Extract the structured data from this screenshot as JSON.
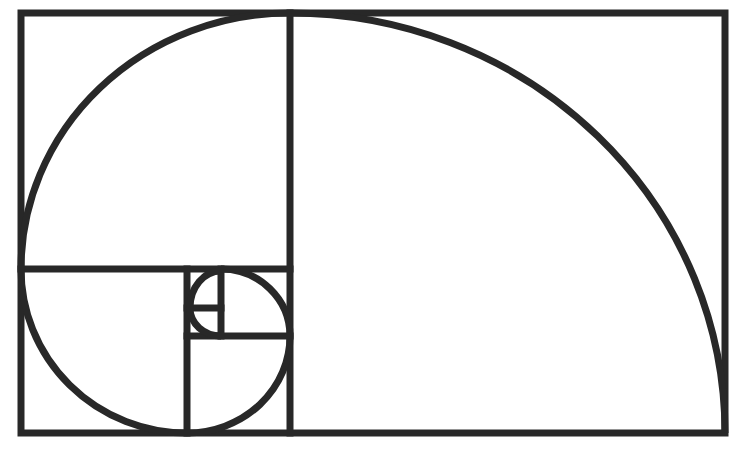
{
  "diagram": {
    "stroke_color": "#282828",
    "background": "#ffffff",
    "stroke_width": 7,
    "outer_rect": {
      "x": 21,
      "y": 13,
      "w": 704,
      "h": 420
    },
    "divider_lines": [
      {
        "name": "main-vertical-divider",
        "x1": 290,
        "y1": 13,
        "x2": 290,
        "y2": 433
      },
      {
        "name": "left-horizontal-divider",
        "x1": 21,
        "y1": 269,
        "x2": 290,
        "y2": 269
      },
      {
        "name": "lower-left-vertical-divider",
        "x1": 187,
        "y1": 269,
        "x2": 187,
        "y2": 433
      },
      {
        "name": "lower-middle-horizontal-divider",
        "x1": 187,
        "y1": 336,
        "x2": 290,
        "y2": 336
      },
      {
        "name": "inner-vertical-divider",
        "x1": 221,
        "y1": 269,
        "x2": 221,
        "y2": 336
      },
      {
        "name": "innermost-horizontal-divider",
        "x1": 187,
        "y1": 308,
        "x2": 221,
        "y2": 308
      }
    ],
    "spiral_arcs": [
      {
        "name": "arc-large-square",
        "d": "M 290 13 A 435 420 0 0 1 725 433"
      },
      {
        "name": "arc-top-left-square",
        "d": "M 21 269 A 269 256 0 0 1 290 13"
      },
      {
        "name": "arc-bottom-left-square",
        "d": "M 187 433 A 166 164 0 0 1 21 269"
      },
      {
        "name": "arc-bottom-middle-square",
        "d": "M 290 336 A 103 97 0 0 1 187 433"
      },
      {
        "name": "arc-right-small-square",
        "d": "M 221 269 A 69 67 0 0 1 290 336"
      },
      {
        "name": "arc-innermost-top",
        "d": "M 190 308 A 31 37 0 0 1 221 271"
      },
      {
        "name": "arc-innermost-bottom",
        "d": "M 221 336 A 31 28 0 0 1 190 308"
      }
    ]
  }
}
